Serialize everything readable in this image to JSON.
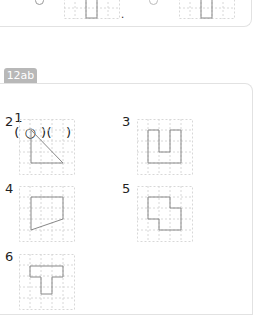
{
  "previous_card": {
    "punctuation": ".",
    "grids": [
      {
        "shape": "vertical-rectangle"
      },
      {
        "shape": "vertical-rectangle"
      }
    ]
  },
  "section": {
    "tag": "12ab",
    "answer_line": {
      "number": "1",
      "text": "( ○ )(   )"
    },
    "items": [
      {
        "number": "2",
        "shape": "right-triangle"
      },
      {
        "number": "3",
        "shape": "u-shape"
      },
      {
        "number": "4",
        "shape": "trapezoid"
      },
      {
        "number": "5",
        "shape": "stepped-polygon"
      },
      {
        "number": "6",
        "shape": "t-shape"
      }
    ]
  },
  "colors": {
    "tag_bg": "#b8b8b8",
    "grid_line": "#d8d8d8",
    "shape_stroke": "#888888",
    "card_border": "#e2e2e2"
  }
}
